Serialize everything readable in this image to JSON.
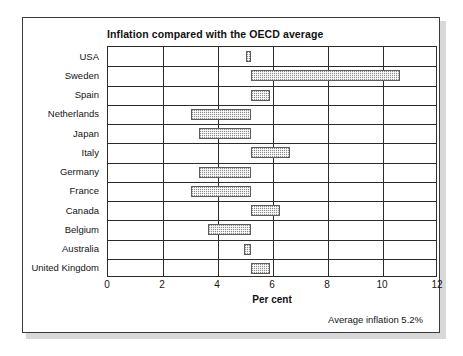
{
  "figure": {
    "title": "Inflation compared with the OECD average",
    "footnote": "Average inflation 5.2%",
    "frame_color": "#3a3a3a",
    "bar_color": "#8a8a8a"
  },
  "chart_data": {
    "type": "bar",
    "orientation": "horizontal",
    "title": "Inflation compared with the OECD average",
    "xlabel": "Per cent",
    "ylabel": "",
    "xlim": [
      0,
      12
    ],
    "xticks": [
      0,
      2,
      4,
      6,
      8,
      10,
      12
    ],
    "xticklabels": [
      "0",
      "2",
      "4",
      "6",
      "8",
      "10",
      "12"
    ],
    "grid": true,
    "legend": null,
    "baseline": 5.2,
    "baseline_note": "Bars are drawn as deviations from the OECD average inflation of 5.2 per cent",
    "categories": [
      "USA",
      "Sweden",
      "Spain",
      "Netherlands",
      "Japan",
      "Italy",
      "Germany",
      "France",
      "Canada",
      "Belgium",
      "Australia",
      "United Kingdom"
    ],
    "values": [
      5.0,
      10.6,
      5.9,
      3.0,
      3.3,
      6.6,
      3.3,
      3.0,
      6.25,
      3.65,
      4.95,
      5.9
    ],
    "bars": [
      {
        "category": "USA",
        "value": 5.0,
        "start": 5.0,
        "end": 5.2
      },
      {
        "category": "Sweden",
        "value": 10.6,
        "start": 5.2,
        "end": 10.6
      },
      {
        "category": "Spain",
        "value": 5.9,
        "start": 5.2,
        "end": 5.9
      },
      {
        "category": "Netherlands",
        "value": 3.0,
        "start": 3.0,
        "end": 5.2
      },
      {
        "category": "Japan",
        "value": 3.3,
        "start": 3.3,
        "end": 5.2
      },
      {
        "category": "Italy",
        "value": 6.6,
        "start": 5.2,
        "end": 6.6
      },
      {
        "category": "Germany",
        "value": 3.3,
        "start": 3.3,
        "end": 5.2
      },
      {
        "category": "France",
        "value": 3.0,
        "start": 3.0,
        "end": 5.2
      },
      {
        "category": "Canada",
        "value": 6.25,
        "start": 5.2,
        "end": 6.25
      },
      {
        "category": "Belgium",
        "value": 3.65,
        "start": 3.65,
        "end": 5.2
      },
      {
        "category": "Australia",
        "value": 4.95,
        "start": 4.95,
        "end": 5.2
      },
      {
        "category": "United Kingdom",
        "value": 5.9,
        "start": 5.2,
        "end": 5.9
      }
    ],
    "annotations": [
      "Average inflation 5.2%"
    ]
  }
}
